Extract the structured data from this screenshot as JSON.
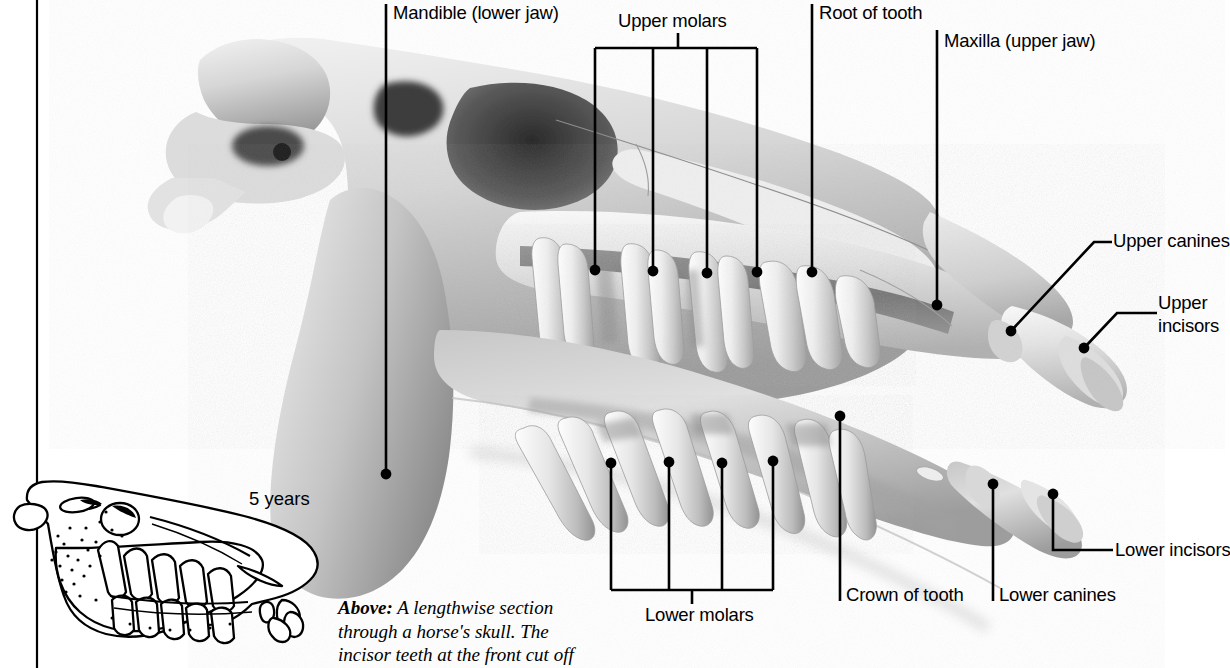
{
  "figure": {
    "title_caption_lead": "Above:",
    "caption_text": " A lengthwise section through a horse's skull. The incisor teeth at the front cut off",
    "caption_line1": "Above:  A lengthwise section",
    "caption_line2": "through a horse's skull. The",
    "caption_line3": "incisor teeth at the front cut off"
  },
  "inset": {
    "age_label": "5 years"
  },
  "labels": {
    "mandible": "Mandible (lower jaw)",
    "upper_molars": "Upper molars",
    "root_of_tooth": "Root of tooth",
    "maxilla": "Maxilla (upper jaw)",
    "upper_canines": "Upper canines",
    "upper_incisors_line1": "Upper",
    "upper_incisors_line2": "incisors",
    "lower_incisors": "Lower incisors",
    "lower_canines": "Lower canines",
    "crown_of_tooth": "Crown of tooth",
    "lower_molars": "Lower molars"
  },
  "colors": {
    "ink": "#000000",
    "background": "#ffffff",
    "bone_light": "#e9e9e9",
    "bone_mid": "#b8b8b8",
    "bone_dark": "#6f6f6f",
    "bone_shadow": "#3a3a3a"
  }
}
